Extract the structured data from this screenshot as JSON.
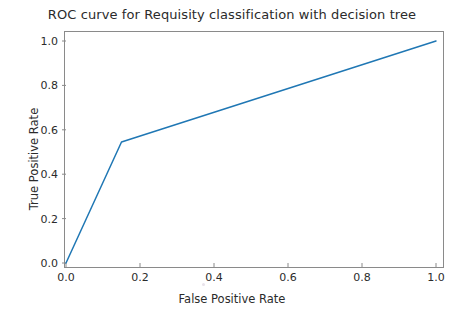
{
  "figure": {
    "width": 464,
    "height": 314,
    "background": "#ffffff",
    "line_color": "#1f77b4",
    "axis_color": "#8a8a8a",
    "text_color": "#2b2b2b"
  },
  "chart_data": {
    "type": "line",
    "title": "ROC curve for Requisity classification with decision tree",
    "xlabel": "False Positive Rate",
    "ylabel": "True Positive Rate",
    "xlim": [
      -0.05,
      1.05
    ],
    "ylim": [
      -0.05,
      1.05
    ],
    "xticks": [
      0.0,
      0.2,
      0.4,
      0.6,
      0.8,
      1.0
    ],
    "yticks": [
      0.0,
      0.2,
      0.4,
      0.6,
      0.8,
      1.0
    ],
    "xticklabels": [
      "0.0",
      "0.2",
      "0.4",
      "0.6",
      "0.8",
      "1.0"
    ],
    "yticklabels": [
      "0.0",
      "0.2",
      "0.4",
      "0.6",
      "0.8",
      "1.0"
    ],
    "grid": false,
    "legend": null,
    "series": [
      {
        "name": "ROC curve",
        "color": "#1f77b4",
        "linewidth": 1.5,
        "x": [
          0.0,
          0.15,
          1.0
        ],
        "y": [
          0.0,
          0.545,
          1.0
        ]
      }
    ]
  }
}
